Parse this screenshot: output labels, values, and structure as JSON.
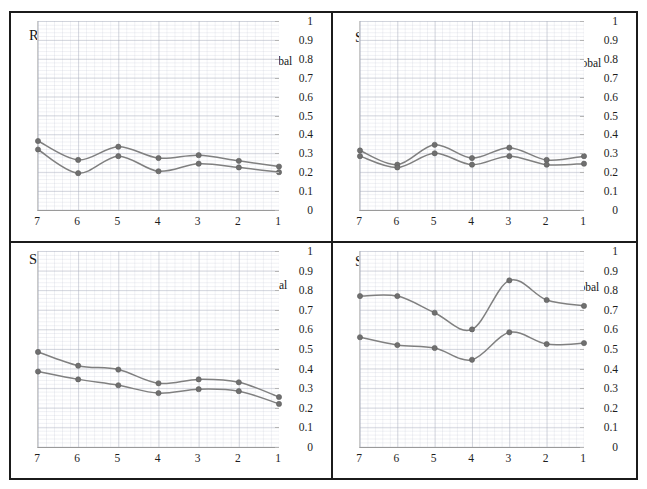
{
  "figure": {
    "border_color": "#1b1b1b",
    "background": "#ffffff",
    "line_color": "#808080",
    "marker_color": "#6f6f6f"
  },
  "panels": [
    {
      "title": "Regular structure",
      "legend": [
        "PG0",
        "DI Global"
      ]
    },
    {
      "title": "Setback irregularity",
      "legend": [
        "PG0",
        "DI Global"
      ]
    },
    {
      "title": "Short column",
      "legend": [
        "PG0",
        "DI Global"
      ]
    },
    {
      "title": "Soft story",
      "legend": [
        "PG0",
        "DI Global"
      ]
    }
  ],
  "chart_data": [
    {
      "type": "line",
      "title": "Regular structure",
      "xlabel": "",
      "ylabel": "",
      "x": [
        7,
        6,
        5,
        4,
        3,
        2,
        1
      ],
      "categories": [
        "7",
        "6",
        "5",
        "4",
        "3",
        "2",
        "1"
      ],
      "xtick_labels": [
        "7",
        "6",
        "5",
        "4",
        "3",
        "2",
        "1"
      ],
      "ytick_labels": [
        "0",
        "0.1",
        "0.2",
        "0.3",
        "0.4",
        "0.5",
        "0.6",
        "0.7",
        "0.8",
        "0.9",
        "1"
      ],
      "ylim": [
        0,
        1
      ],
      "grid": true,
      "legend_position": "top-right",
      "series": [
        {
          "name": "PG0",
          "values": [
            0.32,
            0.195,
            0.285,
            0.205,
            0.245,
            0.225,
            0.2
          ]
        },
        {
          "name": "DI Global",
          "values": [
            0.365,
            0.265,
            0.335,
            0.275,
            0.29,
            0.26,
            0.23
          ]
        }
      ]
    },
    {
      "type": "line",
      "title": "Setback irregularity",
      "xlabel": "",
      "ylabel": "",
      "x": [
        7,
        6,
        5,
        4,
        3,
        2,
        1
      ],
      "categories": [
        "7",
        "6",
        "5",
        "4",
        "3",
        "2",
        "1"
      ],
      "xtick_labels": [
        "7",
        "6",
        "5",
        "4",
        "3",
        "2",
        "1"
      ],
      "ytick_labels": [
        "0",
        "0.1",
        "0.2",
        "0.3",
        "0.4",
        "0.5",
        "0.6",
        "0.7",
        "0.8",
        "0.9",
        "1"
      ],
      "ylim": [
        0,
        1
      ],
      "grid": true,
      "legend_position": "top-right",
      "series": [
        {
          "name": "PG0",
          "values": [
            0.315,
            0.24,
            0.345,
            0.275,
            0.33,
            0.265,
            0.285
          ]
        },
        {
          "name": "DI Global",
          "values": [
            0.285,
            0.225,
            0.3,
            0.24,
            0.285,
            0.24,
            0.245
          ]
        }
      ]
    },
    {
      "type": "line",
      "title": "Short column",
      "xlabel": "",
      "ylabel": "",
      "x": [
        7,
        6,
        5,
        4,
        3,
        2,
        1
      ],
      "categories": [
        "7",
        "6",
        "5",
        "4",
        "3",
        "2",
        "1"
      ],
      "xtick_labels": [
        "7",
        "6",
        "5",
        "4",
        "3",
        "2",
        "1"
      ],
      "ytick_labels": [
        "0",
        "0.1",
        "0.2",
        "0.3",
        "0.4",
        "0.5",
        "0.6",
        "0.7",
        "0.8",
        "0.9",
        "1"
      ],
      "ylim": [
        0,
        1
      ],
      "grid": true,
      "legend_position": "top-right",
      "series": [
        {
          "name": "PG0",
          "values": [
            0.385,
            0.345,
            0.315,
            0.275,
            0.295,
            0.285,
            0.22
          ]
        },
        {
          "name": "DI Global",
          "values": [
            0.485,
            0.415,
            0.395,
            0.325,
            0.345,
            0.33,
            0.255
          ]
        }
      ]
    },
    {
      "type": "line",
      "title": "Soft story",
      "xlabel": "",
      "ylabel": "",
      "x": [
        7,
        6,
        5,
        4,
        3,
        2,
        1
      ],
      "categories": [
        "7",
        "6",
        "5",
        "4",
        "3",
        "2",
        "1"
      ],
      "xtick_labels": [
        "7",
        "6",
        "5",
        "4",
        "3",
        "2",
        "1"
      ],
      "ytick_labels": [
        "0",
        "0.1",
        "0.2",
        "0.3",
        "0.4",
        "0.5",
        "0.6",
        "0.7",
        "0.8",
        "0.9",
        "1"
      ],
      "ylim": [
        0,
        1
      ],
      "grid": true,
      "legend_position": "top-right",
      "series": [
        {
          "name": "PG0",
          "values": [
            0.56,
            0.52,
            0.505,
            0.445,
            0.585,
            0.525,
            0.53
          ]
        },
        {
          "name": "DI Global",
          "values": [
            0.77,
            0.77,
            0.685,
            0.6,
            0.85,
            0.75,
            0.72
          ]
        }
      ]
    }
  ]
}
